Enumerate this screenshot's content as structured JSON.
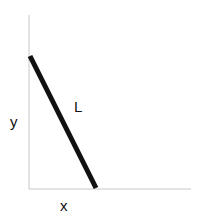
{
  "diagram": {
    "labels": {
      "y_axis": "y",
      "x_axis": "x",
      "segment": "L"
    },
    "colors": {
      "axis": "#c8c8c8",
      "segment": "#111111",
      "text": "#111111"
    }
  }
}
